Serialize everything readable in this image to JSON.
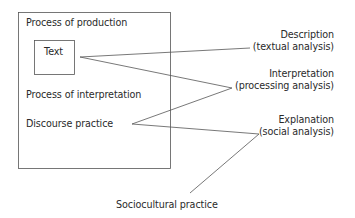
{
  "diagram": {
    "outer_box": {
      "labels": {
        "production": "Process of production",
        "interpretation": "Process of interpretation",
        "discourse": "Discourse practice"
      }
    },
    "inner_box": {
      "label": "Text"
    },
    "outside_label": "Sociocultural practice",
    "dimensions": [
      {
        "title": "Description",
        "subtitle": "(textual analysis)"
      },
      {
        "title": "Interpretation",
        "subtitle": "(processing analysis)"
      },
      {
        "title": "Explanation",
        "subtitle": "(social analysis)"
      }
    ],
    "colors": {
      "line": "#555555",
      "text": "#2a2a2a"
    }
  }
}
